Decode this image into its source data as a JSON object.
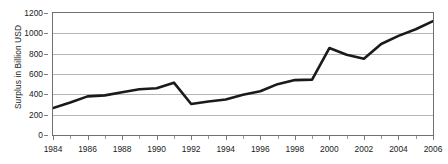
{
  "chart_data": {
    "type": "line",
    "title": "",
    "xlabel": "",
    "ylabel": "Surplus in Billion USD",
    "ylim": [
      0,
      1200
    ],
    "xlim": [
      1984,
      2006
    ],
    "grid": true,
    "legend": false,
    "y_ticks": [
      0,
      200,
      400,
      600,
      800,
      1000,
      1200
    ],
    "y_tick_labels": [
      "0",
      "200",
      "400",
      "600",
      "800",
      "1000",
      "1200"
    ],
    "x_ticks": [
      1984,
      1986,
      1988,
      1990,
      1992,
      1994,
      1996,
      1998,
      2000,
      2002,
      2004,
      2006
    ],
    "x_tick_labels": [
      "1984",
      "1986",
      "1988",
      "1990",
      "1992",
      "1994",
      "1996",
      "1998",
      "2000",
      "2002",
      "2004",
      "2006"
    ],
    "x_minor_ticks": [
      1985,
      1987,
      1989,
      1991,
      1993,
      1995,
      1997,
      1999,
      2001,
      2003,
      2005
    ],
    "series": [
      {
        "name": "Surplus",
        "color": "#1a1a1a",
        "line_width": 2.6,
        "x": [
          1984,
          1985,
          1986,
          1987,
          1988,
          1989,
          1990,
          1991,
          1992,
          1993,
          1994,
          1995,
          1996,
          1997,
          1998,
          1999,
          2000,
          2001,
          2002,
          2003,
          2004,
          2005,
          2006
        ],
        "values": [
          265,
          320,
          380,
          390,
          420,
          450,
          460,
          515,
          305,
          330,
          350,
          395,
          430,
          500,
          540,
          545,
          855,
          790,
          750,
          895,
          975,
          1040,
          1120
        ]
      }
    ]
  },
  "axis": {
    "y_title": "Surplus in Billion USD"
  },
  "colors": {
    "line": "#1a1a1a",
    "gridline": "#b5b5b5",
    "frame": "#6f6f6f",
    "text": "#1a1a1a",
    "background": "#ffffff"
  }
}
